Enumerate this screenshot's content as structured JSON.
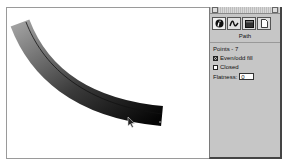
{
  "canvas": {
    "path": {
      "gradient_start": "#9a9a9a",
      "gradient_end": "#0a0a0a",
      "center_line": "#111111"
    },
    "cursor": "arrow-pointer"
  },
  "inspector": {
    "tabs": [
      {
        "name": "info-tab",
        "icon": "info-icon",
        "active": true
      },
      {
        "name": "stroke-tab",
        "icon": "stroke-squiggle-icon",
        "active": false
      },
      {
        "name": "fill-tab",
        "icon": "fill-swatch-icon",
        "active": false
      },
      {
        "name": "document-tab",
        "icon": "document-icon",
        "active": false
      }
    ],
    "title": "Path",
    "points_label": "Points - 7",
    "even_odd_fill": {
      "label": "Even/odd fill",
      "checked": true
    },
    "closed": {
      "label": "Closed",
      "checked": false
    },
    "flatness": {
      "label": "Flatness:",
      "value": "0"
    }
  }
}
